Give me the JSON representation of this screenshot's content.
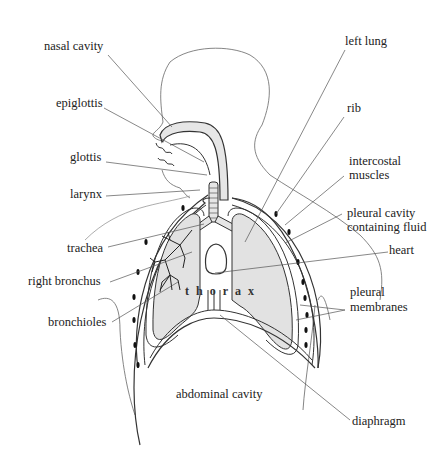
{
  "diagram": {
    "colors": {
      "line": "#333333",
      "leader": "#555555",
      "lung_fill": "#e2e2e2",
      "trachea_fill": "#e6e6e6"
    },
    "labels": {
      "nasal_cavity": "nasal cavity",
      "epiglottis": "epiglottis",
      "glottis": "glottis",
      "larynx": "larynx",
      "trachea": "trachea",
      "right_bronchus": "right bronchus",
      "bronchioles": "bronchioles",
      "left_lung": "left lung",
      "rib": "rib",
      "intercostal_muscles_1": "intercostal",
      "intercostal_muscles_2": "muscles",
      "pleural_cavity_1": "pleural cavity",
      "pleural_cavity_2": "containing fluid",
      "heart": "heart",
      "pleural_membranes_1": "pleural",
      "pleural_membranes_2": "membranes",
      "abdominal_cavity": "abdominal cavity",
      "diaphragm": "diaphragm",
      "thorax": "thorax"
    }
  }
}
